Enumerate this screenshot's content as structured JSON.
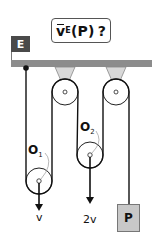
{
  "title": {
    "symbol": "v",
    "subscript": "E",
    "argument": "(P)",
    "question_mark": "?"
  },
  "frame_label": "E",
  "pulleys": {
    "O1": {
      "label": "O",
      "subscript": "1"
    },
    "O2": {
      "label": "O",
      "subscript": "2"
    }
  },
  "velocities": {
    "O1": "v",
    "O2": "2v"
  },
  "load": {
    "label": "P"
  },
  "colors": {
    "ceiling": "#8c8c8c",
    "frame_label_bg": "#4a4a4a",
    "mount": "#d8d8d8",
    "load_fill": "#c8c8c8",
    "rope": "#111111"
  }
}
